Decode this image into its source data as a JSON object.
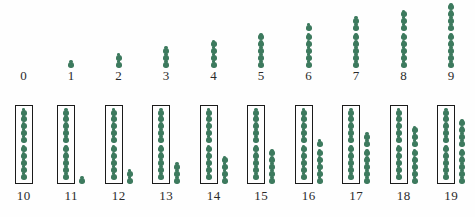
{
  "chart_data": {
    "type": "bar",
    "title": "",
    "subtitle": "",
    "xlabel": "",
    "ylabel": "",
    "grid": false,
    "legend": null,
    "group_size": 5,
    "box_size": 10,
    "categories": [
      "0",
      "1",
      "2",
      "3",
      "4",
      "5",
      "6",
      "7",
      "8",
      "9",
      "10",
      "11",
      "12",
      "13",
      "14",
      "15",
      "16",
      "17",
      "18",
      "19"
    ],
    "values": [
      0,
      1,
      2,
      3,
      4,
      5,
      6,
      7,
      8,
      9,
      10,
      11,
      12,
      13,
      14,
      15,
      16,
      17,
      18,
      19
    ],
    "ylim": [
      0,
      19
    ]
  },
  "colors": {
    "dot": "#3d7a5e",
    "box_outline": "#1b1b1b",
    "label": "#2a2a2a",
    "background": "#fefefe"
  },
  "rows": [
    {
      "name": "ones-row",
      "columns": [
        {
          "label": "0",
          "total": 0,
          "boxed": 0,
          "loose": 0
        },
        {
          "label": "1",
          "total": 1,
          "boxed": 0,
          "loose": 1
        },
        {
          "label": "2",
          "total": 2,
          "boxed": 0,
          "loose": 2
        },
        {
          "label": "3",
          "total": 3,
          "boxed": 0,
          "loose": 3
        },
        {
          "label": "4",
          "total": 4,
          "boxed": 0,
          "loose": 4
        },
        {
          "label": "5",
          "total": 5,
          "boxed": 0,
          "loose": 5
        },
        {
          "label": "6",
          "total": 6,
          "boxed": 0,
          "loose": 6
        },
        {
          "label": "7",
          "total": 7,
          "boxed": 0,
          "loose": 7
        },
        {
          "label": "8",
          "total": 8,
          "boxed": 0,
          "loose": 8
        },
        {
          "label": "9",
          "total": 9,
          "boxed": 0,
          "loose": 9
        }
      ]
    },
    {
      "name": "teens-row",
      "columns": [
        {
          "label": "10",
          "total": 10,
          "boxed": 10,
          "loose": 0
        },
        {
          "label": "11",
          "total": 11,
          "boxed": 10,
          "loose": 1
        },
        {
          "label": "12",
          "total": 12,
          "boxed": 10,
          "loose": 2
        },
        {
          "label": "13",
          "total": 13,
          "boxed": 10,
          "loose": 3
        },
        {
          "label": "14",
          "total": 14,
          "boxed": 10,
          "loose": 4
        },
        {
          "label": "15",
          "total": 15,
          "boxed": 10,
          "loose": 5
        },
        {
          "label": "16",
          "total": 16,
          "boxed": 10,
          "loose": 6
        },
        {
          "label": "17",
          "total": 17,
          "boxed": 10,
          "loose": 7
        },
        {
          "label": "18",
          "total": 18,
          "boxed": 10,
          "loose": 8
        },
        {
          "label": "19",
          "total": 19,
          "boxed": 10,
          "loose": 9
        }
      ]
    }
  ]
}
